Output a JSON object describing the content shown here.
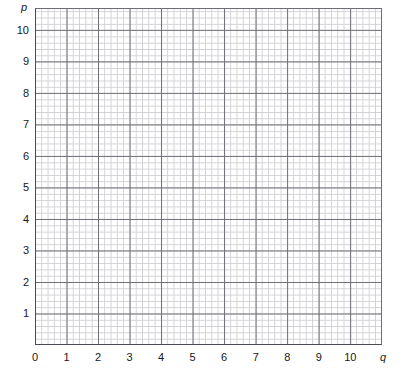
{
  "figure": {
    "kind": "blank-graph-paper",
    "background_color": "#ffffff",
    "axis_line_color": "#4a4a52",
    "major_grid_color": "#6d6d75",
    "minor_grid_color": "#c9c9cf",
    "label_color": "#17171a"
  },
  "axes": {
    "y": {
      "name": "p",
      "name_style": "italic",
      "min": 0,
      "max": 10.69,
      "major_step": 1,
      "minor_per_major": 5,
      "tick_labels": [
        "10",
        "9",
        "8",
        "7",
        "6",
        "5",
        "4",
        "3",
        "2",
        "1"
      ],
      "tick_values": [
        10,
        9,
        8,
        7,
        6,
        5,
        4,
        3,
        2,
        1
      ]
    },
    "x": {
      "name": "q",
      "name_style": "italic",
      "min": 0,
      "max": 11.0,
      "major_step": 1,
      "minor_per_major": 5,
      "tick_labels": [
        "0",
        "1",
        "2",
        "3",
        "4",
        "5",
        "6",
        "7",
        "8",
        "9",
        "10"
      ],
      "tick_values": [
        0,
        1,
        2,
        3,
        4,
        5,
        6,
        7,
        8,
        9,
        10
      ]
    }
  },
  "grid": {
    "show_major": true,
    "show_minor": true,
    "major_spacing_px": 31.53,
    "minor_spacing_px": 6.306
  },
  "plot_area": {
    "left_px": 35,
    "top_px": 8,
    "width_px": 347,
    "height_px": 337
  },
  "series": []
}
